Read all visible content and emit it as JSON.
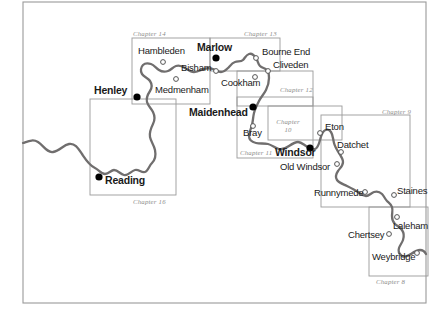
{
  "map": {
    "title": "River Thames chapter index map",
    "colors": {
      "river": "#706e6e",
      "box_border": "#9a9a9a",
      "frame_border": "#9a9a9a",
      "label_text": "#1a1a1a",
      "chapter_text": "#8d8d8d",
      "marker_major_fill": "#000000",
      "marker_minor_fill": "#ffffff",
      "marker_minor_stroke": "#555555",
      "background": "#ffffff"
    },
    "frame": {
      "left": 23,
      "top": 2,
      "right": 426,
      "bottom": 303
    },
    "places": [
      {
        "name": "Hambleden",
        "type": "minor",
        "marker_x": 163,
        "marker_y": 62,
        "label_x": 138,
        "label_y": 46
      },
      {
        "name": "Marlow",
        "type": "major",
        "marker_x": 216,
        "marker_y": 58,
        "label_x": 197,
        "label_y": 42
      },
      {
        "name": "Bourne End",
        "type": "minor",
        "marker_x": 256,
        "marker_y": 58,
        "label_x": 262,
        "label_y": 47
      },
      {
        "name": "Bisham",
        "type": "minor",
        "marker_x": 216,
        "marker_y": 71,
        "label_x": 181,
        "label_y": 63
      },
      {
        "name": "Cliveden",
        "type": "minor",
        "marker_x": 268,
        "marker_y": 71,
        "label_x": 273,
        "label_y": 60
      },
      {
        "name": "Medmenham",
        "type": "minor",
        "marker_x": 176,
        "marker_y": 79,
        "label_x": 155,
        "label_y": 85
      },
      {
        "name": "Cookham",
        "type": "minor",
        "marker_x": 255,
        "marker_y": 77,
        "label_x": 221,
        "label_y": 78
      },
      {
        "name": "Henley",
        "type": "major",
        "marker_x": 137,
        "marker_y": 97,
        "label_x": 94,
        "label_y": 85
      },
      {
        "name": "Maidenhead",
        "type": "major",
        "marker_x": 253,
        "marker_y": 107,
        "label_x": 189,
        "label_y": 107
      },
      {
        "name": "Bray",
        "type": "minor",
        "marker_x": 253,
        "marker_y": 126,
        "label_x": 243,
        "label_y": 128
      },
      {
        "name": "Eton",
        "type": "minor",
        "marker_x": 320,
        "marker_y": 133,
        "label_x": 325,
        "label_y": 122
      },
      {
        "name": "Windsor",
        "type": "major",
        "marker_x": 310,
        "marker_y": 148,
        "label_x": 275,
        "label_y": 147
      },
      {
        "name": "Datchet",
        "type": "minor",
        "marker_x": 341,
        "marker_y": 152,
        "label_x": 337,
        "label_y": 140
      },
      {
        "name": "Old Windsor",
        "type": "minor",
        "marker_x": 337,
        "marker_y": 164,
        "label_x": 280,
        "label_y": 162
      },
      {
        "name": "Runnymede",
        "type": "minor",
        "marker_x": 365,
        "marker_y": 192,
        "label_x": 314,
        "label_y": 188
      },
      {
        "name": "Staines",
        "type": "minor",
        "marker_x": 394,
        "marker_y": 195,
        "label_x": 397,
        "label_y": 186
      },
      {
        "name": "Laleham",
        "type": "minor",
        "marker_x": 397,
        "marker_y": 217,
        "label_x": 393,
        "label_y": 221
      },
      {
        "name": "Chertsey",
        "type": "minor",
        "marker_x": 389,
        "marker_y": 234,
        "label_x": 348,
        "label_y": 230
      },
      {
        "name": "Weybridge",
        "type": "minor",
        "marker_x": 417,
        "marker_y": 253,
        "label_x": 372,
        "label_y": 252
      },
      {
        "name": "Reading",
        "type": "major",
        "marker_x": 99,
        "marker_y": 177,
        "label_x": 105,
        "label_y": 175
      }
    ],
    "chapter_boxes": [
      {
        "label": "Chapter 14",
        "x": 132,
        "y": 38,
        "w": 78,
        "h": 66,
        "label_x": 133,
        "label_y": 30,
        "label_align": "left",
        "lines": 1
      },
      {
        "label": "Chapter 13",
        "x": 210,
        "y": 38,
        "w": 70,
        "h": 33,
        "label_x": 244,
        "label_y": 30,
        "label_align": "left",
        "lines": 1
      },
      {
        "label": "Chapter 12",
        "x": 237,
        "y": 71,
        "w": 76,
        "h": 35,
        "label_x": 280,
        "label_y": 86,
        "label_align": "left",
        "lines": 1
      },
      {
        "label": "Chapter 11",
        "x": 237,
        "y": 97,
        "w": 76,
        "h": 61,
        "label_x": 240,
        "label_y": 149,
        "label_align": "left",
        "lines": 1
      },
      {
        "label": "Chapter 10",
        "x": 268,
        "y": 106,
        "w": 74,
        "h": 34,
        "label_x": 288,
        "label_y": 118,
        "label_align": "center",
        "lines": 2
      },
      {
        "label": "Chapter 9",
        "x": 321,
        "y": 115,
        "w": 89,
        "h": 92,
        "label_x": 382,
        "label_y": 108,
        "label_align": "left",
        "lines": 1
      },
      {
        "label": "Chapter 8",
        "x": 369,
        "y": 207,
        "w": 59,
        "h": 69,
        "label_x": 376,
        "label_y": 278,
        "label_align": "left",
        "lines": 1
      },
      {
        "label": "Chapter 16",
        "x": 90,
        "y": 99,
        "w": 86,
        "h": 96,
        "label_x": 133,
        "label_y": 198,
        "label_align": "left",
        "lines": 1
      }
    ],
    "river_path": "M23,143 C29,141 33,139 38,142 C44,146 47,153 53,152 C60,151 63,145 69,144 C75,143 78,148 82,154 C86,160 89,165 95,168 C99,170 101,174 105,174 C109,174 111,170 114,170 C118,170 120,174 124,175 C128,176 131,171 135,170 C139,169 141,173 145,172 C148,171 149,166 152,163 C155,160 156,155 155,150 C154,145 151,142 150,137 C149,132 151,128 153,124 C155,120 155,116 153,112 C151,108 148,106 147,102 C146,98 148,94 150,91 C152,88 152,84 150,81 C148,78 144,77 142,74 C140,71 141,67 143,65 C145,63 148,63 151,64 C154,65 156,68 159,70 C162,72 165,72 168,71 C171,70 173,67 176,66 C179,65 182,66 185,68 C188,70 191,72 194,72 C198,72 201,70 204,69 C207,68 210,68 213,69 C216,70 218,72 221,72 C224,72 226,70 228,68 C230,66 232,63 235,62 C238,61 241,62 243,60 C245,58 246,55 249,54 C252,53 254,55 256,58 C258,61 258,64 260,66 C262,68 265,68 267,70 C269,72 269,75 269,78 C269,82 268,86 266,90 C264,94 261,97 259,101 C257,105 255,109 254,113 C253,117 253,121 252,125 C251,129 249,132 249,136 C249,140 252,142 256,143 C260,144 264,143 268,144 C272,145 275,148 279,149 C283,150 286,148 289,146 C292,144 295,142 298,142 C301,142 303,144 306,146 C309,148 312,150 315,149 C318,148 319,144 320,140 C321,136 322,133 324,131 C326,129 329,129 331,132 C333,135 333,139 334,143 C335,147 337,150 339,153 C341,156 343,159 343,162 C343,166 340,168 338,171 C336,174 335,177 337,180 C339,183 343,184 347,186 C351,188 355,190 358,192 C361,194 363,196 366,196 C369,196 371,193 374,192 C377,191 380,192 382,194 C384,196 385,199 387,201 C389,203 391,204 392,207 C393,210 392,213 392,216 C392,219 393,222 395,224 C397,226 400,227 402,230 C404,233 404,237 403,240 C402,243 400,245 399,248 C398,251 399,254 402,256 C405,258 408,256 411,254 C414,252 417,250 420,250 C423,250 425,252 426,254",
    "river_width": 2.3
  }
}
